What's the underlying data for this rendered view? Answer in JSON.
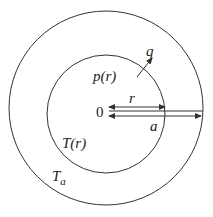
{
  "diagram": {
    "labels": {
      "flux": "q",
      "density": "p(r)",
      "origin": "0",
      "radius_var": "r",
      "radius_outer": "a",
      "temperature_inner": "T(r)",
      "temperature_outer": "T",
      "temperature_outer_sub": "a"
    },
    "colors": {
      "stroke": "#333333",
      "background": "#ffffff"
    }
  }
}
